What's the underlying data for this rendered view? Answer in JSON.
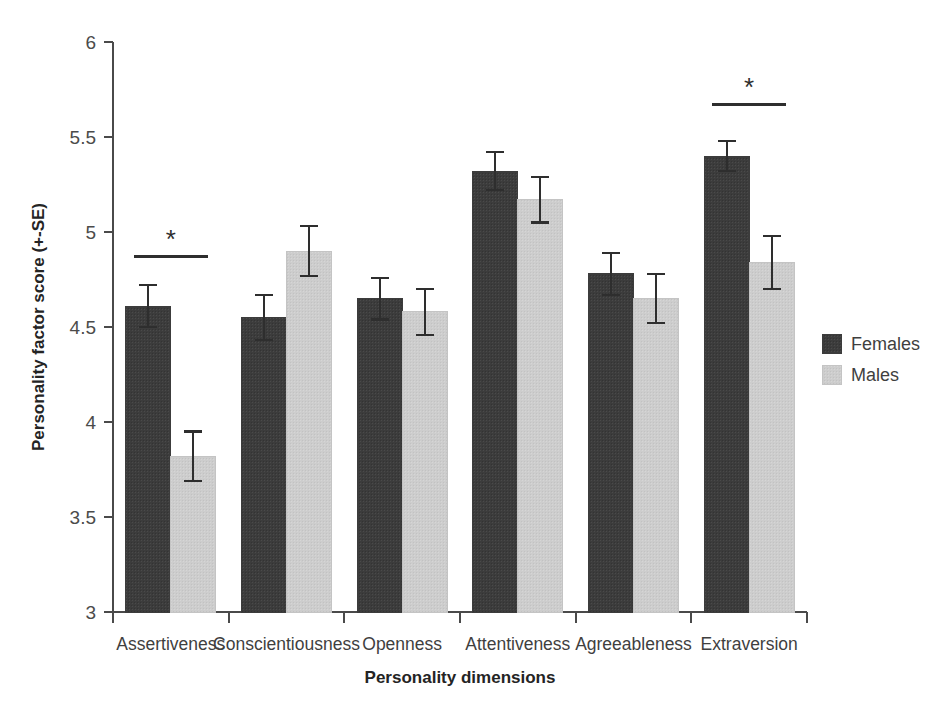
{
  "chart_data": {
    "type": "bar",
    "title": "",
    "xlabel": "Personality dimensions",
    "ylabel": "Personality factor score (+-SE)",
    "categories": [
      "Assertiveness",
      "Conscientiousness",
      "Openness",
      "Attentiveness",
      "Agreeableness",
      "Extraversion"
    ],
    "series": [
      {
        "name": "Females",
        "color": "#3c3c3c",
        "values": [
          4.61,
          4.55,
          4.65,
          5.32,
          4.78,
          5.4
        ],
        "errors": [
          0.11,
          0.12,
          0.11,
          0.1,
          0.11,
          0.08
        ]
      },
      {
        "name": "Males",
        "color": "#cdcdcd",
        "values": [
          3.82,
          4.9,
          4.58,
          5.17,
          4.65,
          4.84
        ],
        "errors": [
          0.13,
          0.13,
          0.12,
          0.12,
          0.13,
          0.14
        ]
      }
    ],
    "ylim": [
      3,
      6
    ],
    "yticks": [
      3,
      3.5,
      4,
      4.5,
      5,
      5.5,
      6
    ],
    "ytick_labels": [
      "3",
      "3.5",
      "4",
      "4.5",
      "5",
      "5.5",
      "6"
    ],
    "grid": false,
    "legend_position": "right",
    "significance": [
      {
        "category": "Assertiveness",
        "marker": "*",
        "y": 4.87
      },
      {
        "category": "Extraversion",
        "marker": "*",
        "y": 5.67
      }
    ]
  },
  "legend": {
    "entries": [
      {
        "label": "Females",
        "color": "#3c3c3c"
      },
      {
        "label": "Males",
        "color": "#cdcdcd"
      }
    ]
  }
}
